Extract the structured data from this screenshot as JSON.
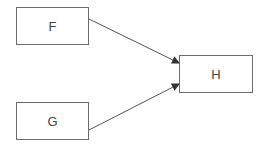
{
  "diagram": {
    "nodes": [
      {
        "id": "F",
        "label": "F"
      },
      {
        "id": "G",
        "label": "G"
      },
      {
        "id": "H",
        "label": "H"
      }
    ],
    "edges": [
      {
        "from": "F",
        "to": "H"
      },
      {
        "from": "G",
        "to": "H"
      }
    ],
    "colors": {
      "stroke": "#6b6b6b",
      "text": "#444444",
      "background": "#ffffff"
    }
  }
}
